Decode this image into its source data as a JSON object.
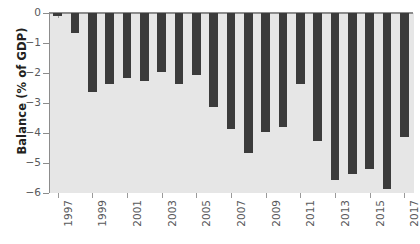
{
  "chart_data": {
    "type": "bar",
    "title": "",
    "xlabel": "",
    "ylabel": "Balance (% of GDP)",
    "ylim": [
      -6,
      0
    ],
    "yticks": [
      0,
      -1,
      -2,
      -3,
      -4,
      -5,
      -6
    ],
    "ytick_labels": [
      "0",
      "−1",
      "−2",
      "−3",
      "−4",
      "−5",
      "−6"
    ],
    "categories": [
      "1997",
      "1998",
      "1999",
      "2000",
      "2001",
      "2002",
      "2003",
      "2004",
      "2005",
      "2006",
      "2007",
      "2008",
      "2009",
      "2010",
      "2011",
      "2012",
      "2013",
      "2014",
      "2015",
      "2016",
      "2017"
    ],
    "xtick_labels": [
      "1997",
      "1999",
      "2001",
      "2003",
      "2005",
      "2007",
      "2009",
      "2011",
      "2013",
      "2015",
      "2017"
    ],
    "values": [
      -0.1,
      -0.65,
      -2.62,
      -2.38,
      -2.18,
      -2.28,
      -1.95,
      -2.38,
      -2.08,
      -3.12,
      -3.85,
      -4.65,
      -3.95,
      -3.8,
      -2.35,
      -4.28,
      -5.58,
      -5.35,
      -5.2,
      -5.85,
      -4.12
    ],
    "grid": false,
    "legend": null,
    "bar_color": "#3b3b3b",
    "plot_background": "#e6e6e6",
    "axis_color": "#8c8c8c",
    "tick_label_color": "#58595b",
    "figure_background": "#ffffff"
  }
}
